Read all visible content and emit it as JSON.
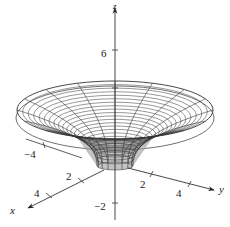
{
  "chart_data": {
    "type": "surface3d",
    "title": "",
    "axes": {
      "x": {
        "label": "x",
        "ticks": [
          2,
          4,
          -4
        ],
        "tick_labels": [
          "2",
          "4",
          "−4"
        ]
      },
      "y": {
        "label": "y",
        "ticks": [
          2,
          4
        ],
        "tick_labels": [
          "2",
          "4"
        ]
      },
      "z": {
        "label": "z",
        "ticks": [
          6,
          -2
        ],
        "tick_labels": [
          "6",
          "−2"
        ]
      }
    },
    "surface": {
      "shape": "funnel",
      "rim_radius_approx": 6,
      "rim_height_approx": 4,
      "throat_height_approx": 0,
      "mesh": "radial and circular wireframe lines"
    },
    "grid": false,
    "legend": null
  },
  "labels": {
    "x_axis": "x",
    "y_axis": "y",
    "z_axis": "z",
    "x_tick_2": "2",
    "x_tick_4": "4",
    "x_tick_neg4": "−4",
    "y_tick_2": "2",
    "y_tick_4": "4",
    "z_tick_6": "6",
    "z_tick_neg2": "−2"
  },
  "colors": {
    "axis": "#222222",
    "mesh": "#333333",
    "inner_shade": "#9a9a9a",
    "background": "#ffffff"
  }
}
